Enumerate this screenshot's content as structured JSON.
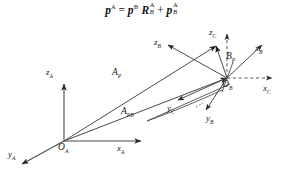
{
  "figure": {
    "background_color": "#ffffff",
    "line_color": "#3c3c3c",
    "text_color": "#1b1b1b",
    "width": 283,
    "height": 172
  },
  "equation": {
    "full_text": "p^A = p^B R_B^A + p_B^A",
    "lhs_var": "p",
    "lhs_sup": "A",
    "equals": "=",
    "term1_var": "p",
    "term1_sup": "B",
    "rot_var": "R",
    "rot_sup": "A",
    "rot_sub": "B",
    "plus": "+",
    "term2_var": "p",
    "term2_sup": "A",
    "term2_sub": "B"
  },
  "labels": {
    "z_a": {
      "base": "z",
      "sub": "A"
    },
    "y_a": {
      "base": "y",
      "sub": "A"
    },
    "x_a": {
      "base": "x",
      "sub": "A"
    },
    "o_a": {
      "base": "O",
      "sub": "A"
    },
    "z_b": {
      "base": "z",
      "sub": "B"
    },
    "y_b": {
      "base": "y",
      "sub": "B"
    },
    "x_b": {
      "base": "x",
      "sub": "B"
    },
    "o_b": {
      "base": "O",
      "sub": "B"
    },
    "z_c": {
      "base": "z",
      "sub": "C"
    },
    "y_c": {
      "base": "y",
      "sub": "C"
    },
    "x_c": {
      "base": "x",
      "sub": "C"
    },
    "point_b": {
      "base": "B",
      "sub": "P"
    },
    "vec_p": {
      "base": "A",
      "sub": "P"
    },
    "vec_pb": {
      "base": "A",
      "sub": "PB"
    }
  },
  "frames": [
    {
      "name": "frame-a",
      "origin": "O_A",
      "axes": [
        "x_A",
        "y_A",
        "z_A"
      ]
    },
    {
      "name": "frame-b",
      "origin": "O_B",
      "axes": [
        "x_B",
        "y_B",
        "z_B"
      ]
    },
    {
      "name": "frame-c",
      "origin": "O_B",
      "axes": [
        "x_C",
        "y_C",
        "z_C"
      ]
    }
  ],
  "vectors": [
    {
      "name": "vector-p",
      "label": "A_P",
      "from": "O_A",
      "to": "P"
    },
    {
      "name": "vector-pb",
      "label": "A_PB",
      "from": "O_A",
      "to": "O_B"
    }
  ]
}
